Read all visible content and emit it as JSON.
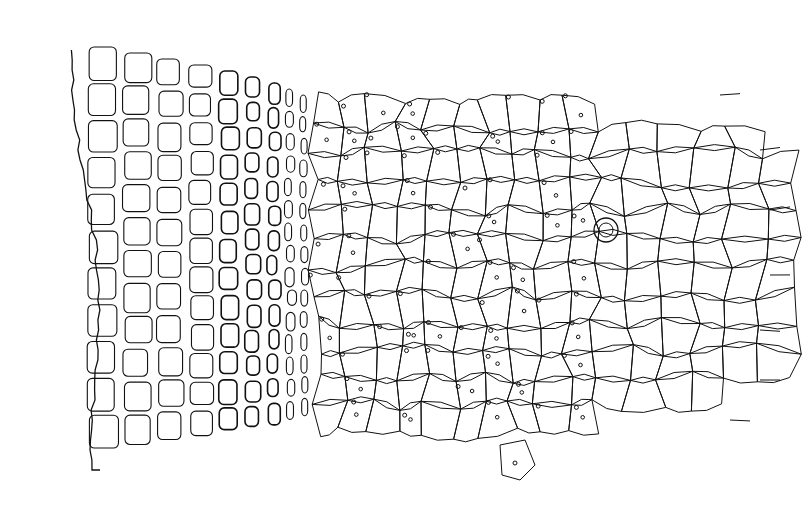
{
  "figure": {
    "title": "",
    "stroke_color": "#111111",
    "background": "#ffffff"
  },
  "regions": [
    {
      "name": "outer-rectangular-cells",
      "x_range": [
        60,
        320
      ]
    },
    {
      "name": "middle-polygonal-cells-with-dots",
      "x_range": [
        320,
        610
      ]
    },
    {
      "name": "right-large-polygonal-cells",
      "x_range": [
        600,
        780
      ]
    }
  ]
}
